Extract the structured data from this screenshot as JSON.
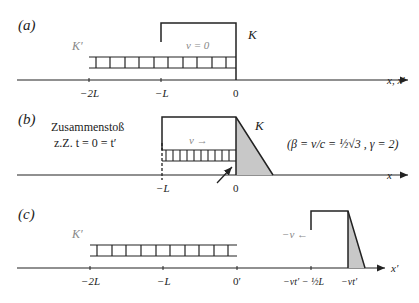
{
  "panels": {
    "a": {
      "label": "(a)",
      "frame_rod": "K′",
      "frame_box": "K",
      "velocity": "v = 0",
      "axis_label": "x, x′",
      "ticks": [
        "−2L",
        "−L",
        "0"
      ]
    },
    "b": {
      "label": "(b)",
      "note_line1": "Zusammenstoß",
      "note_line2": "z.Z. t = 0 = t′",
      "frame_box": "K",
      "velocity": "v →",
      "formula": "(β = v/c = ½√3 , γ = 2)",
      "axis_label": "x",
      "ticks": [
        "−L",
        "0"
      ]
    },
    "c": {
      "label": "(c)",
      "frame_rod": "K′",
      "velocity": "−v ←",
      "axis_label": "x′",
      "ticks": [
        "−2L",
        "−L",
        "0′",
        "−vt′ − ½L",
        "−vt′"
      ]
    }
  },
  "colors": {
    "line": "#222222",
    "shade": "#c8c8c8"
  }
}
